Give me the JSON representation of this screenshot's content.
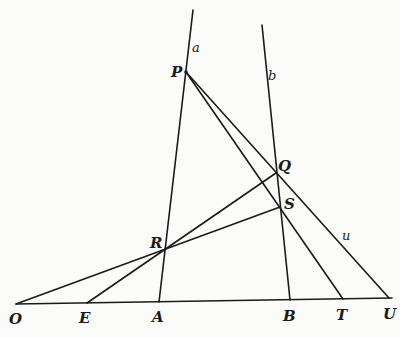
{
  "figure": {
    "colors": {
      "ink": "#1a1a1a",
      "paper": "#fbfbf9"
    },
    "points": {
      "P": {
        "label": "P",
        "x": 186,
        "y": 72
      },
      "Q": {
        "label": "Q",
        "x": 276,
        "y": 173
      },
      "S": {
        "label": "S",
        "x": 280,
        "y": 207
      },
      "R": {
        "label": "R",
        "x": 165,
        "y": 249
      },
      "O": {
        "label": "O",
        "x": 16,
        "y": 304
      },
      "E": {
        "label": "E",
        "x": 87,
        "y": 303
      },
      "A": {
        "label": "A",
        "x": 159,
        "y": 302
      },
      "B": {
        "label": "B",
        "x": 290,
        "y": 300
      },
      "T": {
        "label": "T",
        "x": 343,
        "y": 299
      },
      "U": {
        "label": "U",
        "x": 389,
        "y": 298
      }
    },
    "line_labels": {
      "a": "a",
      "b": "b",
      "u": "u"
    },
    "lines": [
      {
        "name": "line-a",
        "from": [
          193,
          10
        ],
        "to": [
          159,
          302
        ]
      },
      {
        "name": "line-b",
        "from": [
          262,
          25
        ],
        "to": [
          290,
          300
        ]
      },
      {
        "name": "base-line-OU",
        "from": [
          16,
          304
        ],
        "to": [
          392,
          298
        ]
      },
      {
        "name": "line-PU",
        "from": [
          186,
          72
        ],
        "to": [
          389,
          298
        ]
      },
      {
        "name": "line-PT",
        "from": [
          186,
          72
        ],
        "to": [
          343,
          299
        ]
      },
      {
        "name": "line-OS",
        "from": [
          16,
          304
        ],
        "to": [
          280,
          207
        ]
      },
      {
        "name": "line-EQ",
        "from": [
          87,
          303
        ],
        "to": [
          276,
          173
        ]
      }
    ]
  }
}
